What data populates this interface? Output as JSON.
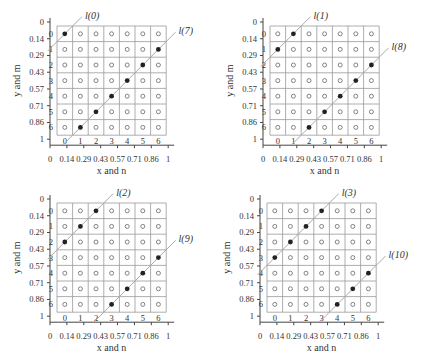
{
  "figure": {
    "grid_size": 7,
    "x_axis_label": "x and n",
    "y_axis_label": "y and m",
    "continuous_ticks": [
      "0",
      "0.14",
      "0.29",
      "0.43",
      "0.57",
      "0.71",
      "0.86",
      "1"
    ],
    "index_ticks": [
      "0",
      "1",
      "2",
      "3",
      "4",
      "5",
      "6"
    ],
    "colors": {
      "grid": "#999999",
      "axis": "#444444",
      "line": "#aaaaaa",
      "filled_dot": "#222222",
      "hollow_dot": "#666666"
    }
  },
  "panels": [
    {
      "id": "top-left",
      "lines": [
        {
          "label": "l(0)",
          "offset": 0,
          "points": [
            [
              0,
              0
            ]
          ]
        },
        {
          "label": "l(7)",
          "offset": 7,
          "points": [
            [
              1,
              6
            ],
            [
              2,
              5
            ],
            [
              3,
              4
            ],
            [
              4,
              3
            ],
            [
              5,
              2
            ],
            [
              6,
              1
            ]
          ]
        }
      ]
    },
    {
      "id": "top-right",
      "lines": [
        {
          "label": "l(1)",
          "offset": 1,
          "points": [
            [
              1,
              0
            ],
            [
              0,
              1
            ]
          ]
        },
        {
          "label": "l(8)",
          "offset": 8,
          "points": [
            [
              2,
              6
            ],
            [
              3,
              5
            ],
            [
              4,
              4
            ],
            [
              5,
              3
            ],
            [
              6,
              2
            ]
          ]
        }
      ]
    },
    {
      "id": "bottom-left",
      "lines": [
        {
          "label": "l(2)",
          "offset": 2,
          "points": [
            [
              2,
              0
            ],
            [
              1,
              1
            ],
            [
              0,
              2
            ]
          ]
        },
        {
          "label": "l(9)",
          "offset": 9,
          "points": [
            [
              3,
              6
            ],
            [
              4,
              5
            ],
            [
              5,
              4
            ],
            [
              6,
              3
            ]
          ]
        }
      ]
    },
    {
      "id": "bottom-right",
      "lines": [
        {
          "label": "l(3)",
          "offset": 3,
          "points": [
            [
              3,
              0
            ],
            [
              2,
              1
            ],
            [
              1,
              2
            ],
            [
              0,
              3
            ]
          ]
        },
        {
          "label": "l(10)",
          "offset": 10,
          "points": [
            [
              4,
              6
            ],
            [
              5,
              5
            ],
            [
              6,
              4
            ]
          ]
        }
      ]
    }
  ]
}
